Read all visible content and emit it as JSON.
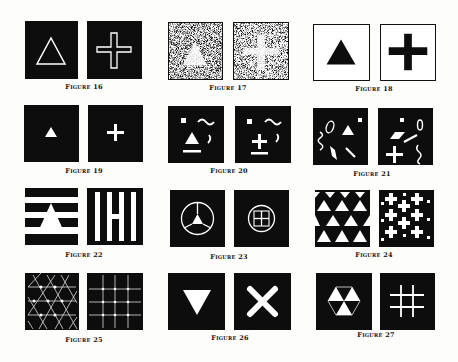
{
  "figures": {
    "f16": {
      "caption": "Figure 16",
      "left": "outline-triangle",
      "right": "outline-cross"
    },
    "f17": {
      "caption": "Figure 17",
      "left": "faint-triangle-in-noise",
      "right": "faint-cross-in-noise"
    },
    "f18": {
      "caption": "Figure 18",
      "left": "black-triangle-on-white",
      "right": "black-cross-on-white"
    },
    "f19": {
      "caption": "Figure 19",
      "left": "small-triangle",
      "right": "small-cross"
    },
    "f20": {
      "caption": "Figure 20",
      "left": "triangle-with-distractors",
      "right": "cross-with-distractors"
    },
    "f21": {
      "caption": "Figure 21",
      "left": "triangle-scattered-shapes",
      "right": "cross-scattered-shapes"
    },
    "f22": {
      "caption": "Figure 22",
      "left": "triangle-horizontal-stripes",
      "right": "cross-vertical-stripes"
    },
    "f23": {
      "caption": "Figure 23",
      "left": "triangle-in-circle",
      "right": "cross-in-circle"
    },
    "f24": {
      "caption": "Figure 24",
      "left": "triangle-tessellation",
      "right": "cross-tessellation"
    },
    "f25": {
      "caption": "Figure 25",
      "left": "triangle-lattice",
      "right": "square-grid-lattice"
    },
    "f26": {
      "caption": "Figure 26",
      "left": "inverted-triangle",
      "right": "diagonal-cross"
    },
    "f27": {
      "caption": "Figure 27",
      "left": "hexagon-triangles",
      "right": "hash-grid"
    }
  },
  "colors": {
    "ink": "#0d0d0d",
    "paper": "#fdfdfb",
    "figure": "#ffffff"
  }
}
